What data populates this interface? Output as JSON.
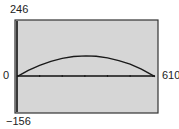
{
  "chart_data": {
    "type": "line",
    "title": "",
    "xlabel": "",
    "ylabel": "",
    "xlim": [
      0,
      610
    ],
    "ylim": [
      -156,
      246
    ],
    "x_tick_spacing": 100,
    "grid": false,
    "series": [
      {
        "name": "parabola",
        "x": [
          0,
          50,
          100,
          150,
          200,
          250,
          305,
          350,
          400,
          450,
          500,
          550,
          610
        ],
        "values": [
          0,
          28,
          50,
          68,
          81,
          89,
          92,
          90,
          83,
          71,
          55,
          33,
          0
        ]
      }
    ]
  },
  "labels": {
    "ymax": "246",
    "ymin": "−156",
    "xmin": "0",
    "xmax": "610"
  },
  "colors": {
    "screen_bg": "#d6d6d6",
    "line": "#1a1a1a",
    "frame": "#333333"
  }
}
